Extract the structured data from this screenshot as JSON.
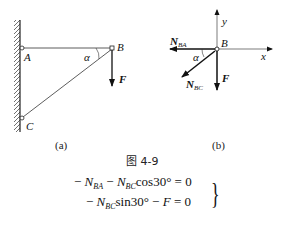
{
  "figure_a": {
    "points": {
      "A": "A",
      "B": "B",
      "C": "C"
    },
    "angle_label": "α",
    "force_label": "F",
    "caption": "(a)"
  },
  "figure_b": {
    "point": "B",
    "axis_x": "x",
    "axis_y": "y",
    "angle_label": "α",
    "n_ba": {
      "main": "N",
      "sub": "BA"
    },
    "n_bc": {
      "main": "N",
      "sub": "BC"
    },
    "force_label": "F",
    "caption": "(b)"
  },
  "figure_number": "图 4-9",
  "equations": [
    {
      "parts": [
        "− ",
        "N",
        "BA",
        " − ",
        "N",
        "BC",
        "cos30° = 0"
      ]
    },
    {
      "parts": [
        "− ",
        "N",
        "BC",
        "sin30° − ",
        "F",
        " = 0"
      ]
    }
  ]
}
